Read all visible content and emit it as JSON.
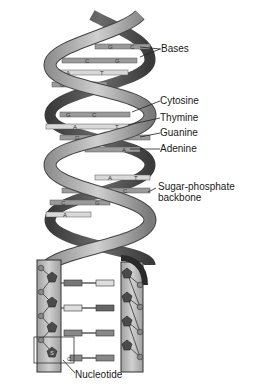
{
  "diagram": {
    "labels": {
      "bases": "Bases",
      "cytosine": "Cytosine",
      "thymine": "Thymine",
      "guanine": "Guanine",
      "adenine": "Adenine",
      "backbone_line1": "Sugar-phosphate",
      "backbone_line2": "backbone",
      "nucleotide": "Nucleotide"
    },
    "base_pairs": [
      {
        "left": "G",
        "right": "C"
      },
      {
        "left": "C",
        "right": "G"
      },
      {
        "left": "A",
        "right": "T"
      },
      {
        "left": "G",
        "right": "C"
      },
      {
        "left": "G",
        "right": "C"
      },
      {
        "left": "A",
        "right": "T"
      },
      {
        "left": "G",
        "right": "C"
      },
      {
        "left": "T",
        "right": "A"
      },
      {
        "left": "A",
        "right": "T"
      },
      {
        "left": "G",
        "right": "C"
      },
      {
        "left": "C",
        "right": "G"
      },
      {
        "left": "A",
        "right": "T"
      }
    ],
    "nucleotide_parts": {
      "phosphate": "P",
      "sugar": "S",
      "base": "C"
    },
    "colors": {
      "ribbon_light": "#b8b8b8",
      "ribbon_dark": "#555555",
      "base_bar": "#9a9a9a",
      "base_light": "#d8d8d8",
      "sugar": "#4a4a4a"
    }
  }
}
